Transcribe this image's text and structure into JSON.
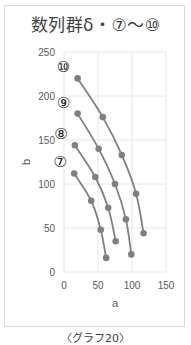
{
  "title": "数列群δ・⑦〜⑩",
  "caption": "〈グラフ20〉",
  "colors": {
    "series": "#808080",
    "grid": "#e6e6e6",
    "axis_text": "#595959"
  },
  "chart_data": {
    "type": "scatter",
    "title": "数列群δ・⑦〜⑩",
    "xlabel": "a",
    "ylabel": "b",
    "xlim": [
      0,
      150
    ],
    "ylim": [
      0,
      250
    ],
    "x_ticks": [
      0,
      50,
      100,
      150
    ],
    "y_ticks": [
      0,
      50,
      100,
      150,
      200,
      250
    ],
    "grid": true,
    "legend": "none (series labeled inline)",
    "series": [
      {
        "name": "⑦",
        "points": [
          [
            15,
            112
          ],
          [
            40,
            81
          ],
          [
            54,
            48
          ],
          [
            62,
            16
          ]
        ]
      },
      {
        "name": "⑧",
        "points": [
          [
            16,
            144
          ],
          [
            46,
            108
          ],
          [
            65,
            73
          ],
          [
            76,
            35
          ]
        ]
      },
      {
        "name": "⑨",
        "points": [
          [
            20,
            180
          ],
          [
            51,
            140
          ],
          [
            75,
            100
          ],
          [
            91,
            60
          ],
          [
            99,
            20
          ]
        ]
      },
      {
        "name": "⑩",
        "points": [
          [
            20,
            220
          ],
          [
            57,
            176
          ],
          [
            85,
            133
          ],
          [
            106,
            89
          ],
          [
            117,
            44
          ]
        ]
      }
    ]
  }
}
